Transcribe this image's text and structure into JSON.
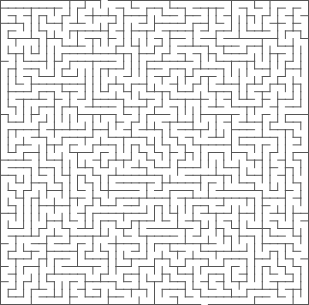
{
  "maze": {
    "cols": 40,
    "rows": 40,
    "width": 309,
    "height": 305,
    "wall_color": "#555555",
    "background_color": "#ffffff",
    "wall_width": 1,
    "seed": 20240611,
    "entrance": {
      "col": 13,
      "side": "top"
    },
    "exit": {
      "col": 26,
      "side": "bottom"
    }
  }
}
